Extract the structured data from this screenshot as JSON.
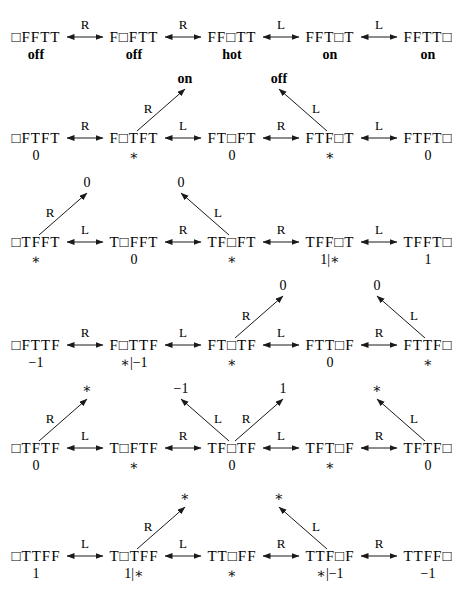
{
  "page": {
    "background": "#ffffff",
    "ink": "#1a1a1a"
  },
  "diagram": {
    "rows": [
      {
        "nodes": [
          {
            "tape": "□FFTT",
            "label": "off",
            "bold_label": true
          },
          {
            "tape": "F□FTT",
            "label": "off",
            "bold_label": true
          },
          {
            "tape": "FF□TT",
            "label": "hot",
            "bold_label": true
          },
          {
            "tape": "FFT□T",
            "label": "on",
            "bold_label": true
          },
          {
            "tape": "FFTT□",
            "label": "on",
            "bold_label": true
          }
        ],
        "moves": [
          "R",
          "R",
          "L",
          "L"
        ],
        "exits": []
      },
      {
        "nodes": [
          {
            "tape": "□FTFT",
            "label": "0"
          },
          {
            "tape": "F□TFT",
            "label": "∗"
          },
          {
            "tape": "FT□FT",
            "label": "0"
          },
          {
            "tape": "FTF□T",
            "label": "∗"
          },
          {
            "tape": "FTFT□",
            "label": "0"
          }
        ],
        "moves": [
          "R",
          "L",
          "R",
          "L"
        ],
        "exits": [
          {
            "node": 1,
            "direction": "up-right",
            "move": "R",
            "target": "on",
            "bold_target": true
          },
          {
            "node": 3,
            "direction": "up-left",
            "move": "L",
            "target": "off",
            "bold_target": true
          }
        ]
      },
      {
        "nodes": [
          {
            "tape": "□TFFT",
            "label": "∗"
          },
          {
            "tape": "T□FFT",
            "label": "0"
          },
          {
            "tape": "TF□FT",
            "label": "∗"
          },
          {
            "tape": "TFF□T",
            "label": "1|∗"
          },
          {
            "tape": "TFFT□",
            "label": "1"
          }
        ],
        "moves": [
          "L",
          "R",
          "R",
          "L"
        ],
        "exits": [
          {
            "node": 0,
            "direction": "up-right",
            "move": "R",
            "target": "0"
          },
          {
            "node": 2,
            "direction": "up-left",
            "move": "L",
            "target": "0"
          }
        ]
      },
      {
        "nodes": [
          {
            "tape": "□FTTF",
            "label": "−1"
          },
          {
            "tape": "F□TTF",
            "label": "∗|−1"
          },
          {
            "tape": "FT□TF",
            "label": "∗"
          },
          {
            "tape": "FTT□F",
            "label": "0"
          },
          {
            "tape": "FTTF□",
            "label": "∗"
          }
        ],
        "moves": [
          "R",
          "L",
          "L",
          "R"
        ],
        "exits": [
          {
            "node": 2,
            "direction": "up-right",
            "move": "R",
            "target": "0"
          },
          {
            "node": 4,
            "direction": "up-left",
            "move": "L",
            "target": "0"
          }
        ]
      },
      {
        "nodes": [
          {
            "tape": "□TFTF",
            "label": "0"
          },
          {
            "tape": "T□FTF",
            "label": "∗"
          },
          {
            "tape": "TF□TF",
            "label": "0"
          },
          {
            "tape": "TFT□F",
            "label": "∗"
          },
          {
            "tape": "TFTF□",
            "label": "0"
          }
        ],
        "moves": [
          "L",
          "R",
          "L",
          "R"
        ],
        "exits": [
          {
            "node": 0,
            "direction": "up-right",
            "move": "R",
            "target": "∗"
          },
          {
            "node": 2,
            "direction": "up-left",
            "move": "L",
            "target": "−1"
          },
          {
            "node": 2,
            "direction": "up-right",
            "move": "R",
            "target": "1"
          },
          {
            "node": 4,
            "direction": "up-left",
            "move": "L",
            "target": "∗"
          }
        ]
      },
      {
        "nodes": [
          {
            "tape": "□TTFF",
            "label": "1"
          },
          {
            "tape": "T□TFF",
            "label": "1|∗"
          },
          {
            "tape": "TT□FF",
            "label": "∗"
          },
          {
            "tape": "TTF□F",
            "label": "∗|−1"
          },
          {
            "tape": "TTFF□",
            "label": "−1"
          }
        ],
        "moves": [
          "L",
          "L",
          "R",
          "R"
        ],
        "exits": [
          {
            "node": 1,
            "direction": "up-right",
            "move": "R",
            "target": "∗"
          },
          {
            "node": 3,
            "direction": "up-left",
            "move": "L",
            "target": "∗"
          }
        ]
      }
    ]
  }
}
